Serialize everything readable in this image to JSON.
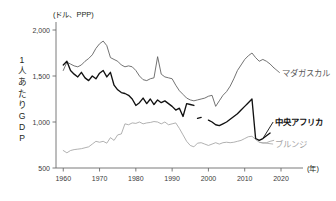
{
  "chart_data": {
    "type": "line",
    "title": "",
    "unit_label": "(ドル、PPP)",
    "ylabel": "1人あたりGDP",
    "ylabel_chars": [
      "1",
      "人",
      "あ",
      "た",
      "り",
      "G",
      "D",
      "P"
    ],
    "xlabel": "(年)",
    "ylim": [
      500,
      2000
    ],
    "xlim": [
      1958,
      2020
    ],
    "yticks": [
      500,
      1000,
      1500,
      2000
    ],
    "ytick_labels": [
      "500",
      "1,000",
      "1,500",
      "2,000"
    ],
    "xticks": [
      1960,
      1970,
      1980,
      1990,
      2000,
      2010,
      2020
    ],
    "xtick_labels": [
      "1960",
      "1970",
      "1980",
      "1990",
      "2000",
      "2010",
      "2020"
    ],
    "grid": false,
    "legend_position": "inline-right",
    "series": [
      {
        "name": "マダガスカル",
        "color": "#5a5a5a",
        "bold": false,
        "label_x": 2017,
        "label_y": 1520,
        "x": [
          1960,
          1961,
          1962,
          1963,
          1964,
          1965,
          1966,
          1967,
          1968,
          1969,
          1970,
          1971,
          1972,
          1973,
          1974,
          1975,
          1976,
          1977,
          1978,
          1979,
          1980,
          1981,
          1982,
          1983,
          1984,
          1985,
          1986,
          1987,
          1988,
          1989,
          1990,
          1991,
          1992,
          1993,
          1994,
          1995,
          1996,
          1997,
          1998,
          1999,
          2000,
          2001,
          2002,
          2003,
          2004,
          2005,
          2006,
          2007,
          2008,
          2009,
          2010,
          2011,
          2012,
          2013,
          2014,
          2015,
          2016,
          2017,
          2018
        ],
        "y": [
          1560,
          1650,
          1630,
          1610,
          1600,
          1620,
          1660,
          1690,
          1730,
          1800,
          1850,
          1880,
          1830,
          1700,
          1680,
          1660,
          1620,
          1600,
          1610,
          1600,
          1560,
          1500,
          1460,
          1450,
          1470,
          1480,
          1710,
          1520,
          1490,
          1480,
          1470,
          1400,
          1340,
          1300,
          1260,
          1240,
          1230,
          1240,
          1250,
          1260,
          1280,
          1290,
          1170,
          1230,
          1290,
          1330,
          1390,
          1470,
          1560,
          1620,
          1680,
          1720,
          1750,
          1700,
          1660,
          1680,
          1660,
          1630,
          1590
        ]
      },
      {
        "name": "中央アフリカ",
        "color": "#111111",
        "bold": true,
        "label_x": 2016,
        "label_y": 1000,
        "segments": [
          {
            "x": [
              1960,
              1961,
              1962,
              1963,
              1964,
              1965,
              1966,
              1967,
              1968,
              1969,
              1970,
              1971,
              1972,
              1973,
              1974,
              1975,
              1976,
              1977,
              1978,
              1979,
              1980,
              1981,
              1982,
              1983,
              1984,
              1985,
              1986,
              1987,
              1988,
              1989,
              1990,
              1991,
              1992,
              1993,
              1994,
              1995,
              1996
            ],
            "y": [
              1620,
              1660,
              1560,
              1520,
              1490,
              1540,
              1480,
              1450,
              1500,
              1470,
              1530,
              1560,
              1490,
              1540,
              1400,
              1350,
              1320,
              1310,
              1290,
              1250,
              1180,
              1210,
              1260,
              1200,
              1250,
              1190,
              1240,
              1210,
              1230,
              1200,
              1170,
              1130,
              1150,
              1060,
              1200,
              1190,
              1180
            ]
          },
          {
            "x": [
              1997,
              1998
            ],
            "y": [
              1040,
              1050
            ]
          },
          {
            "x": [
              2000,
              2001,
              2002,
              2003,
              2004,
              2005,
              2006,
              2007,
              2008,
              2009,
              2010,
              2011,
              2012,
              2013,
              2014,
              2015,
              2016,
              2017
            ],
            "y": [
              1020,
              1000,
              970,
              960,
              980,
              1000,
              1030,
              1060,
              1090,
              1130,
              1170,
              1210,
              1250,
              820,
              800,
              820,
              850,
              880
            ]
          }
        ]
      },
      {
        "name": "ブルンジ",
        "color": "#a3a3a3",
        "bold": false,
        "label_x": 2016,
        "label_y": 830,
        "x": [
          1960,
          1961,
          1962,
          1963,
          1964,
          1965,
          1966,
          1967,
          1968,
          1969,
          1970,
          1971,
          1972,
          1973,
          1974,
          1975,
          1976,
          1977,
          1978,
          1979,
          1980,
          1981,
          1982,
          1983,
          1984,
          1985,
          1986,
          1987,
          1988,
          1989,
          1990,
          1991,
          1992,
          1993,
          1994,
          1995,
          1996,
          1997,
          1998,
          1999,
          2000,
          2001,
          2002,
          2003,
          2004,
          2005,
          2006,
          2007,
          2008,
          2009,
          2010,
          2011,
          2012,
          2013,
          2014,
          2015,
          2016,
          2017,
          2018
        ],
        "y": [
          690,
          665,
          690,
          700,
          705,
          710,
          720,
          730,
          760,
          790,
          780,
          790,
          770,
          830,
          800,
          860,
          870,
          980,
          970,
          990,
          985,
          1000,
          980,
          990,
          995,
          1005,
          1000,
          980,
          1000,
          970,
          980,
          990,
          930,
          860,
          790,
          745,
          730,
          770,
          775,
          760,
          745,
          760,
          775,
          760,
          775,
          780,
          775,
          780,
          790,
          800,
          820,
          840,
          845,
          810,
          780,
          770,
          775,
          790,
          800
        ]
      }
    ]
  }
}
